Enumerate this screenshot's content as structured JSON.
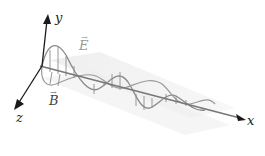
{
  "diagram": {
    "axes": {
      "x": "x",
      "y": "y",
      "z": "z"
    },
    "fields": {
      "E": "E",
      "B": "B",
      "vector_mark": "→"
    },
    "colors": {
      "axis": "#1a1a1a",
      "wave": "#8a8a8a",
      "plane": "#e6e6e6",
      "E_label": "#a0a0a0",
      "B_label": "#333333"
    }
  }
}
